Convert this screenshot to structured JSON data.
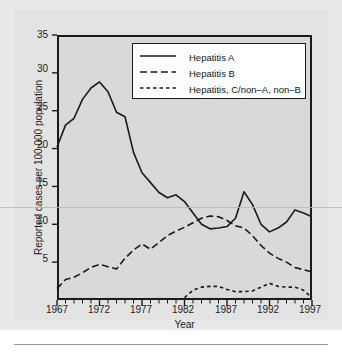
{
  "figure": {
    "background_color": "#e3e3e3",
    "plot_background_color": "#d9d9d9",
    "frame_color": "#1a1a1a"
  },
  "axis": {
    "x_title": "Year",
    "y_title": "Reported cases per 100,000 population",
    "x_tick_labels": [
      "1967",
      "1972",
      "1977",
      "1982",
      "1987",
      "1992",
      "1997"
    ],
    "y_tick_labels": [
      "5",
      "10",
      "15",
      "20",
      "25",
      "30",
      "35"
    ]
  },
  "legend": {
    "items": [
      {
        "label": "Hepatitis A",
        "style": "solid"
      },
      {
        "label": "Hepatitis B",
        "style": "dash-dash"
      },
      {
        "label": "Hepatitis, C/non–A, non–B",
        "style": "dotted-dash"
      }
    ]
  },
  "chart_data": {
    "type": "line",
    "title": "",
    "xlabel": "Year",
    "ylabel": "Reported cases per 100,000 population",
    "xlim": [
      1967,
      1997
    ],
    "ylim": [
      0,
      35
    ],
    "xticks": [
      1967,
      1972,
      1977,
      1982,
      1987,
      1992,
      1997
    ],
    "yticks": [
      0,
      5,
      10,
      15,
      20,
      25,
      30,
      35
    ],
    "minor_xticks_every": 1,
    "grid": false,
    "legend_position": "upper-center",
    "x": [
      1967,
      1968,
      1969,
      1970,
      1971,
      1972,
      1973,
      1974,
      1975,
      1976,
      1977,
      1978,
      1979,
      1980,
      1981,
      1982,
      1983,
      1984,
      1985,
      1986,
      1987,
      1988,
      1989,
      1990,
      1991,
      1992,
      1993,
      1994,
      1995,
      1996,
      1997
    ],
    "series": [
      {
        "name": "Hepatitis A",
        "style": "solid",
        "color": "#1a1a1a",
        "values": [
          20.2,
          23.1,
          24.0,
          26.5,
          28.0,
          28.8,
          27.5,
          24.8,
          24.2,
          19.5,
          16.8,
          15.5,
          14.2,
          13.5,
          13.9,
          13.0,
          11.5,
          10.0,
          9.4,
          9.5,
          9.7,
          10.8,
          14.3,
          12.6,
          10.0,
          9.0,
          9.5,
          10.3,
          11.9,
          11.5,
          11.0
        ]
      },
      {
        "name": "Hepatitis B",
        "style": "dash-dash",
        "color": "#1a1a1a",
        "values": [
          1.5,
          2.7,
          3.0,
          3.6,
          4.3,
          4.7,
          4.4,
          4.1,
          5.5,
          6.6,
          7.4,
          6.7,
          7.6,
          8.5,
          9.1,
          9.6,
          10.2,
          10.8,
          11.1,
          11.0,
          10.5,
          9.8,
          9.5,
          8.5,
          7.2,
          6.2,
          5.5,
          5.0,
          4.3,
          4.0,
          3.7
        ]
      },
      {
        "name": "Hepatitis, C/non–A, non–B",
        "style": "dotted-dash",
        "color": "#1a1a1a",
        "start_year": 1982,
        "values": [
          null,
          null,
          null,
          null,
          null,
          null,
          null,
          null,
          null,
          null,
          null,
          null,
          null,
          null,
          null,
          0.3,
          1.3,
          1.7,
          1.8,
          1.8,
          1.4,
          1.1,
          1.1,
          1.2,
          1.7,
          2.2,
          1.8,
          1.7,
          1.7,
          1.3,
          0.3
        ]
      }
    ]
  }
}
